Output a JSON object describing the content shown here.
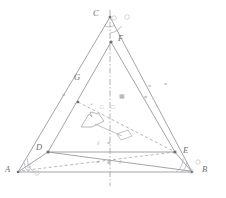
{
  "figure": {
    "type": "line-diagram",
    "background": "#ffffff",
    "stroke_color": "#8d8d93",
    "label_color": "#6e6e72",
    "dash_axis_color": "#9a9aa0",
    "width": 226,
    "height": 198
  },
  "vertices": [
    {
      "id": "A",
      "label": "A",
      "x": 18,
      "y": 172,
      "label_x": 5,
      "label_y": 168
    },
    {
      "id": "B",
      "label": "B",
      "x": 192,
      "y": 172,
      "label_x": 202,
      "label_y": 168
    },
    {
      "id": "C",
      "label": "C",
      "x": 110,
      "y": 17,
      "label_x": 93,
      "label_y": 11
    },
    {
      "id": "D",
      "label": "D",
      "x": 48,
      "y": 152,
      "label_x": 37,
      "label_y": 146
    },
    {
      "id": "E",
      "label": "E",
      "x": 175,
      "y": 152,
      "label_x": 183,
      "label_y": 149
    },
    {
      "id": "F",
      "label": "F",
      "x": 111,
      "y": 42,
      "label_x": 118,
      "label_y": 36
    },
    {
      "id": "G",
      "label": "G",
      "x": 78,
      "y": 102,
      "label_x": 75,
      "label_y": 76
    }
  ],
  "edges": [
    {
      "name": "edge-A-C",
      "from": "A",
      "to": "C",
      "style": "solid"
    },
    {
      "name": "edge-C-B",
      "from": "C",
      "to": "B",
      "style": "solid"
    },
    {
      "name": "edge-A-B",
      "from": "A",
      "to": "B",
      "style": "solid"
    },
    {
      "name": "edge-A-D",
      "from": "A",
      "to": "D",
      "style": "solid"
    },
    {
      "name": "edge-D-F",
      "from": "D",
      "to": "F",
      "style": "solid"
    },
    {
      "name": "edge-F-E",
      "from": "F",
      "to": "E",
      "style": "solid"
    },
    {
      "name": "edge-D-E",
      "from": "D",
      "to": "E",
      "style": "solid"
    },
    {
      "name": "edge-E-B",
      "from": "E",
      "to": "B",
      "style": "solid"
    },
    {
      "name": "edge-D-B",
      "from": "D",
      "to": "B",
      "style": "solid"
    },
    {
      "name": "edge-E-A",
      "from": "E",
      "to": "A",
      "style": "dashed"
    },
    {
      "name": "edge-G-E",
      "from": "G",
      "to": "E",
      "style": "dashed"
    }
  ],
  "axis": {
    "name": "vertical-symmetry-axis",
    "style": "dash-dot",
    "x": 110,
    "y_top": 10,
    "y_bottom": 186
  },
  "angle_marks": [
    {
      "name": "angle-arc-at-A-inner",
      "at": "A",
      "radius": 11
    },
    {
      "name": "angle-arc-at-A-outer",
      "at": "A",
      "radius": 16
    },
    {
      "name": "angle-arc-at-B-inner",
      "at": "B",
      "radius": 11
    },
    {
      "name": "angle-arc-at-B-outer",
      "at": "B",
      "radius": 16
    },
    {
      "name": "angle-arc-at-C-inner",
      "at": "C",
      "radius": 10
    },
    {
      "name": "angle-arc-at-C-outer",
      "at": "C",
      "radius": 16
    }
  ],
  "tick_marks": [
    {
      "name": "tick-single-left-leg",
      "glyph": "=",
      "x": 62,
      "y": 95
    },
    {
      "name": "tick-single-right-leg",
      "glyph": "=",
      "x": 150,
      "y": 87
    },
    {
      "name": "tick-single-far-right",
      "glyph": "=",
      "x": 166,
      "y": 85
    },
    {
      "name": "tick-double-center-up",
      "glyph": "⊞",
      "x": 122,
      "y": 96
    },
    {
      "name": "tick-box-center-left",
      "glyph": "□",
      "x": 103,
      "y": 107
    },
    {
      "name": "tick-box-center-right",
      "glyph": "□",
      "x": 114,
      "y": 107
    },
    {
      "name": "tick-angle-near-G",
      "glyph": "⌄",
      "x": 92,
      "y": 103
    },
    {
      "name": "tick-near-F-right",
      "glyph": "≠",
      "x": 147,
      "y": 97
    },
    {
      "name": "tick-base-equal",
      "glyph": "=",
      "x": 99,
      "y": 162
    },
    {
      "name": "tick-base-triple",
      "glyph": "≡",
      "x": 110,
      "y": 162
    },
    {
      "name": "tick-base-slash",
      "glyph": "⫽",
      "x": 122,
      "y": 162
    },
    {
      "name": "tick-arrow-slash",
      "glyph": "⫽",
      "x": 100,
      "y": 143
    },
    {
      "name": "tick-arrow-equal",
      "glyph": "=",
      "x": 110,
      "y": 143
    }
  ],
  "annotation_arrow": {
    "name": "center-pointer-arrow",
    "description": "small outlined arrow glyph pointing up-left near centroid",
    "x": 88,
    "y": 118
  },
  "annotation_box": {
    "name": "center-tag-box",
    "description": "small outlined parallelogram tag below centroid",
    "x": 120,
    "y": 134
  }
}
